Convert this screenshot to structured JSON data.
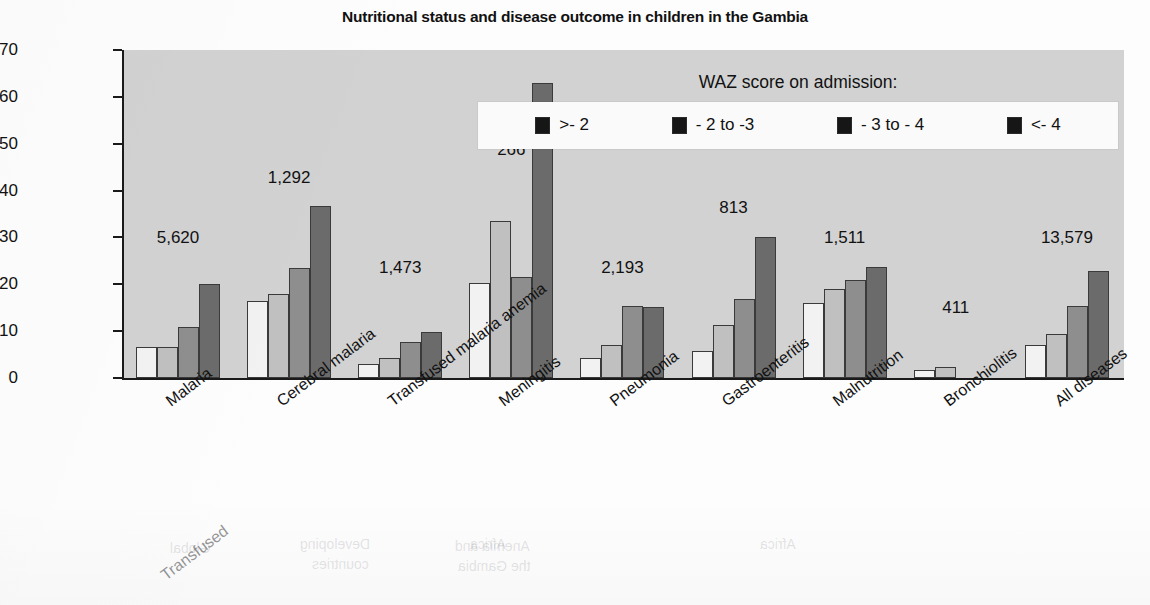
{
  "chart_data": {
    "type": "bar",
    "title": "Nutritional status and disease outcome in children in the Gambia",
    "xlabel": "",
    "ylabel": "% Mortality",
    "ylim": [
      0,
      70
    ],
    "yticks": [
      0,
      10,
      20,
      30,
      40,
      50,
      60,
      70
    ],
    "grid": false,
    "legend_position": "top-right (inside plot)",
    "legend_title": "WAZ score on admission:",
    "categories": [
      "Malaria",
      "Cerebral malaria",
      "Transfused malaria anemia",
      "Meningitis",
      "Pneumonia",
      "Gastroenteritis",
      "Malnutrition",
      "Bronchiolitis",
      "All diseases"
    ],
    "group_counts": [
      "5,620",
      "1,292",
      "1,473",
      "266",
      "2,193",
      "813",
      "1,511",
      "411",
      "13,579"
    ],
    "series": [
      {
        "name": ">- 2",
        "color": "#f2f2f2",
        "values": [
          6.7,
          16.4,
          2.9,
          20.3,
          4.3,
          5.7,
          16.0,
          1.7,
          7.0
        ]
      },
      {
        "name": "- 2 to -3",
        "color": "#c0c0c0",
        "values": [
          6.7,
          17.9,
          4.2,
          33.5,
          7.0,
          11.3,
          19.0,
          2.4,
          9.3
        ]
      },
      {
        "name": "- 3 to - 4",
        "color": "#8e8e8e",
        "values": [
          10.8,
          23.5,
          7.6,
          21.5,
          15.3,
          16.9,
          20.9,
          null,
          15.3
        ]
      },
      {
        "name": "<- 4",
        "color": "#6b6b6b",
        "values": [
          20.0,
          36.7,
          9.8,
          63.0,
          15.2,
          30.2,
          23.6,
          null,
          22.8
        ]
      }
    ]
  },
  "legend": {
    "title": "WAZ score on admission:",
    "items": [
      {
        "label": ">- 2"
      },
      {
        "label": "- 2 to -3"
      },
      {
        "label": "- 3 to - 4"
      },
      {
        "label": "<- 4"
      }
    ]
  },
  "ghost_text": {
    "transfused": "Transfused",
    "fragments": [
      {
        "text": "Global",
        "x": 170,
        "y": 540
      },
      {
        "text": "Developing",
        "x": 300,
        "y": 536
      },
      {
        "text": "countries",
        "x": 312,
        "y": 556
      },
      {
        "text": "Africa",
        "x": 470,
        "y": 536
      },
      {
        "text": "Anemia and",
        "x": 455,
        "y": 538
      },
      {
        "text": "the Gambia",
        "x": 458,
        "y": 558
      },
      {
        "text": "Africa",
        "x": 760,
        "y": 536
      }
    ]
  }
}
